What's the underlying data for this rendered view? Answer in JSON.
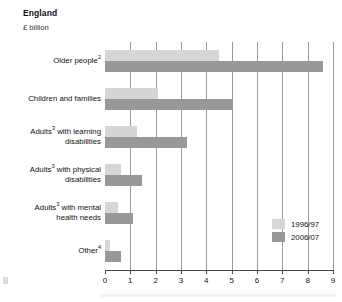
{
  "header": {
    "title": "England",
    "subtitle": "£ billion"
  },
  "legend": {
    "items": [
      {
        "label": "1996/97",
        "color": "#d6d6d6"
      },
      {
        "label": "2006/07",
        "color": "#989898"
      }
    ]
  },
  "axis": {
    "ticks": [
      "0",
      "1",
      "2",
      "3",
      "4",
      "5",
      "6",
      "7",
      "8",
      "9"
    ]
  },
  "categories": [
    {
      "line1": "Older people",
      "sup1": "2",
      "line2": ""
    },
    {
      "line1": "Children and families",
      "sup1": "",
      "line2": ""
    },
    {
      "line1": "Adults",
      "sup1": "3",
      "line1b": " with learning",
      "line2": "disabilities"
    },
    {
      "line1": "Adults",
      "sup1": "3",
      "line1b": " with physical",
      "line2": "disabilities"
    },
    {
      "line1": "Adults",
      "sup1": "3",
      "line1b": " with mental",
      "line2": "health needs"
    },
    {
      "line1": "Other",
      "sup1": "4",
      "line2": ""
    }
  ],
  "chart_data": {
    "type": "bar",
    "orientation": "horizontal",
    "title": "England",
    "subtitle": "£ billion",
    "xlabel": "",
    "ylabel": "",
    "xlim": [
      0,
      9
    ],
    "grid": true,
    "legend_position": "bottom-right",
    "categories": [
      "Older people2",
      "Children and families",
      "Adults3 with learning disabilities",
      "Adults3 with physical disabilities",
      "Adults3 with mental health needs",
      "Other4"
    ],
    "series": [
      {
        "name": "1996/97",
        "color": "#d6d6d6",
        "values": [
          4.5,
          2.1,
          1.25,
          0.65,
          0.5,
          0.2
        ]
      },
      {
        "name": "2006/07",
        "color": "#989898",
        "values": [
          8.6,
          5.0,
          3.25,
          1.45,
          1.1,
          0.65
        ]
      }
    ]
  }
}
